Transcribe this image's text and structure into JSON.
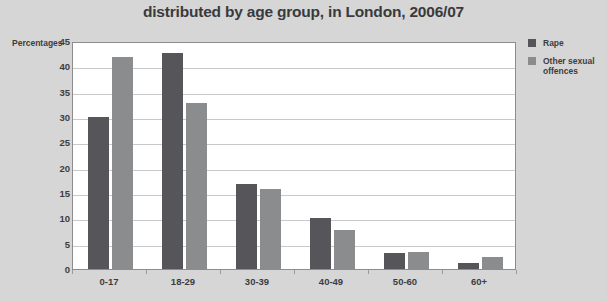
{
  "chart_data": {
    "type": "bar",
    "title": "distributed by age group, in London, 2006/07",
    "xlabel": "",
    "ylabel": "Percentages",
    "categories": [
      "0-17",
      "18-29",
      "30-39",
      "40-49",
      "50-60",
      "60+"
    ],
    "series": [
      {
        "name": "Rape",
        "color": "#56565a",
        "values": [
          30,
          42.6,
          16.8,
          10,
          3.1,
          1.2
        ]
      },
      {
        "name": "Other sexual offences",
        "color": "#8a8c8e",
        "values": [
          41.8,
          32.7,
          15.7,
          7.7,
          3.4,
          2.3
        ]
      }
    ],
    "ylim": [
      0,
      45
    ],
    "yticks": [
      0,
      5,
      10,
      15,
      20,
      25,
      30,
      35,
      40,
      45
    ],
    "ytick_labels": [
      "0",
      "5",
      "10",
      "15",
      "20",
      "25",
      "30",
      "35",
      "40",
      "45"
    ],
    "grid": true,
    "legend_position": "right",
    "legend_entries": [
      "Rape",
      "Other sexual offences"
    ]
  },
  "legend": {
    "entries": [
      {
        "label": "Rape"
      },
      {
        "label": "Other sexual offences"
      }
    ]
  },
  "axis": {
    "y_caption": "Percentages"
  }
}
